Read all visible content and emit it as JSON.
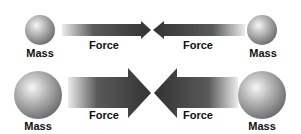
{
  "diagram": {
    "top_row": {
      "left_mass": {
        "label": "Mass",
        "size": "small"
      },
      "left_force": {
        "label": "Force",
        "direction": "right"
      },
      "right_force": {
        "label": "Force",
        "direction": "left"
      },
      "right_mass": {
        "label": "Mass",
        "size": "small"
      }
    },
    "bottom_row": {
      "left_mass": {
        "label": "Mass",
        "size": "large"
      },
      "left_force": {
        "label": "Force",
        "direction": "right"
      },
      "right_force": {
        "label": "Force",
        "direction": "left"
      },
      "right_mass": {
        "label": "Mass",
        "size": "large"
      }
    },
    "colors": {
      "arrow_dark": "#3a3a3a",
      "arrow_light": "#e8e8e8",
      "sphere_light": "#f4f4f4",
      "sphere_mid": "#a8a8a8",
      "sphere_dark": "#6a6a6a",
      "text": "#111111",
      "background": "#ffffff"
    }
  }
}
